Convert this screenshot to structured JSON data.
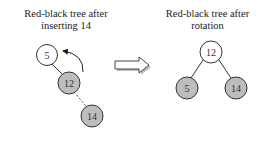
{
  "left_panel": {
    "title_line1": "Red-black tree after",
    "title_line2": "inserting 14",
    "nodes": [
      {
        "label": "5",
        "color": "white"
      },
      {
        "label": "12",
        "color": "gray"
      },
      {
        "label": "14",
        "color": "gray"
      }
    ]
  },
  "right_panel": {
    "title_line1": "Red-black tree after",
    "title_line2": "rotation",
    "nodes": [
      {
        "label": "12",
        "color": "white"
      },
      {
        "label": "5",
        "color": "gray"
      },
      {
        "label": "14",
        "color": "gray"
      }
    ]
  },
  "colors": {
    "red_node": "#bdbdbd",
    "black_node": "#ffffff",
    "stroke": "#333333"
  }
}
